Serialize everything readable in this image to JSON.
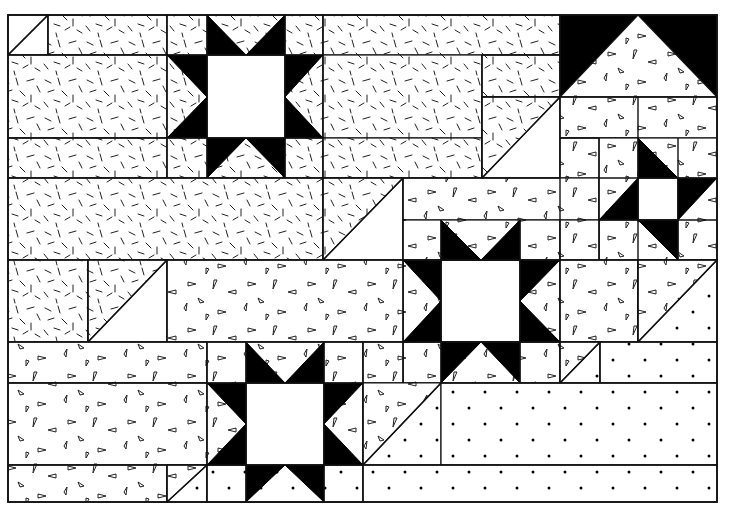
{
  "figure": {
    "colors": {
      "ink": "#000000",
      "background": "#ffffff"
    },
    "bounds": {
      "x": 8,
      "y": 15,
      "w": 709,
      "h": 487
    },
    "fabrics": {
      "dash": "dash-print",
      "tri": "triangle-print",
      "dot": "dot-print",
      "plain": "plain-white",
      "black": "solid-black"
    },
    "patches": [
      {
        "name": "corner-hst-top-left",
        "type": "rect",
        "x": 8,
        "y": 15,
        "w": 40,
        "h": 40,
        "fill": "plain"
      },
      {
        "name": "corner-hst-top-left-dash",
        "type": "poly",
        "points": "8,55 48,15 8,15",
        "fill": "plain"
      },
      {
        "name": "top-strip-1",
        "type": "rect",
        "x": 48,
        "y": 15,
        "w": 119,
        "h": 40,
        "fill": "dash"
      },
      {
        "name": "left-block-1",
        "type": "rect",
        "x": 8,
        "y": 55,
        "w": 159,
        "h": 83,
        "fill": "dash"
      },
      {
        "name": "left-strip-2",
        "type": "rect",
        "x": 8,
        "y": 138,
        "w": 159,
        "h": 40,
        "fill": "dash"
      },
      {
        "name": "star1-bg",
        "type": "rect",
        "x": 167,
        "y": 15,
        "w": 156,
        "h": 163,
        "fill": "dash"
      },
      {
        "name": "star1-center",
        "type": "rect",
        "x": 207,
        "y": 55,
        "w": 78,
        "h": 83,
        "fill": "plain"
      },
      {
        "name": "top-strip-2",
        "type": "rect",
        "x": 323,
        "y": 15,
        "w": 237,
        "h": 40,
        "fill": "dash"
      },
      {
        "name": "mid-block-2",
        "type": "rect",
        "x": 323,
        "y": 55,
        "w": 159,
        "h": 83,
        "fill": "dash"
      },
      {
        "name": "mid-strip-3",
        "type": "rect",
        "x": 323,
        "y": 138,
        "w": 159,
        "h": 40,
        "fill": "dash"
      },
      {
        "name": "small-rect-a",
        "type": "rect",
        "x": 482,
        "y": 55,
        "w": 78,
        "h": 42,
        "fill": "dash"
      },
      {
        "name": "hst-a-plain",
        "type": "rect",
        "x": 482,
        "y": 97,
        "w": 78,
        "h": 81,
        "fill": "plain"
      },
      {
        "name": "hst-a-dash",
        "type": "poly",
        "points": "482,97 560,97 482,178",
        "fill": "dash"
      },
      {
        "name": "house-bg",
        "type": "rect",
        "x": 560,
        "y": 15,
        "w": 157,
        "h": 82,
        "fill": "black"
      },
      {
        "name": "house-tri",
        "type": "poly",
        "points": "560,97 638,15 717,97",
        "fill": "tri"
      },
      {
        "name": "tri-strip-a",
        "type": "rect",
        "x": 560,
        "y": 97,
        "w": 157,
        "h": 41,
        "fill": "tri"
      },
      {
        "name": "tri-rect-b",
        "type": "rect",
        "x": 560,
        "y": 138,
        "w": 78,
        "h": 40,
        "fill": "tri"
      },
      {
        "name": "wide-dash-row",
        "type": "rect",
        "x": 8,
        "y": 178,
        "w": 315,
        "h": 82,
        "fill": "dash"
      },
      {
        "name": "hst-b-plain",
        "type": "rect",
        "x": 323,
        "y": 178,
        "w": 80,
        "h": 82,
        "fill": "plain"
      },
      {
        "name": "hst-b-dash",
        "type": "poly",
        "points": "323,178 403,178 323,260",
        "fill": "dash"
      },
      {
        "name": "tri-strip-c",
        "type": "rect",
        "x": 403,
        "y": 178,
        "w": 196,
        "h": 42,
        "fill": "tri"
      },
      {
        "name": "smallstar-bg",
        "type": "rect",
        "x": 599,
        "y": 138,
        "w": 118,
        "h": 122,
        "fill": "tri"
      },
      {
        "name": "smallstar-center",
        "type": "rect",
        "x": 638,
        "y": 178,
        "w": 40,
        "h": 42,
        "fill": "plain"
      },
      {
        "name": "star2-bg",
        "type": "rect",
        "x": 403,
        "y": 220,
        "w": 157,
        "h": 163,
        "fill": "tri"
      },
      {
        "name": "star2-center",
        "type": "rect",
        "x": 441,
        "y": 260,
        "w": 79,
        "h": 82,
        "fill": "plain"
      },
      {
        "name": "dash-square",
        "type": "rect",
        "x": 8,
        "y": 260,
        "w": 80,
        "h": 82,
        "fill": "dash"
      },
      {
        "name": "hst-c-plain",
        "type": "rect",
        "x": 88,
        "y": 260,
        "w": 79,
        "h": 82,
        "fill": "plain"
      },
      {
        "name": "hst-c-dash",
        "type": "poly",
        "points": "88,260 167,260 88,342",
        "fill": "dash"
      },
      {
        "name": "tri-block-d",
        "type": "rect",
        "x": 167,
        "y": 260,
        "w": 236,
        "h": 82,
        "fill": "tri"
      },
      {
        "name": "tri-rect-e",
        "type": "rect",
        "x": 560,
        "y": 220,
        "w": 39,
        "h": 40,
        "fill": "tri"
      },
      {
        "name": "tri-rect-f",
        "type": "rect",
        "x": 560,
        "y": 260,
        "w": 78,
        "h": 82,
        "fill": "tri"
      },
      {
        "name": "hst-d-dot",
        "type": "rect",
        "x": 638,
        "y": 260,
        "w": 79,
        "h": 82,
        "fill": "dot"
      },
      {
        "name": "hst-d-tri",
        "type": "poly",
        "points": "638,260 717,260 638,342",
        "fill": "tri"
      },
      {
        "name": "tri-strip-g",
        "type": "rect",
        "x": 8,
        "y": 342,
        "w": 199,
        "h": 41,
        "fill": "tri"
      },
      {
        "name": "tri-block-h",
        "type": "rect",
        "x": 8,
        "y": 383,
        "w": 199,
        "h": 82,
        "fill": "tri"
      },
      {
        "name": "tri-strip-i",
        "type": "rect",
        "x": 8,
        "y": 465,
        "w": 159,
        "h": 37,
        "fill": "tri"
      },
      {
        "name": "hst-e-dot",
        "type": "rect",
        "x": 167,
        "y": 465,
        "w": 40,
        "h": 37,
        "fill": "dot"
      },
      {
        "name": "hst-e-tri",
        "type": "poly",
        "points": "167,465 207,465 167,502",
        "fill": "tri"
      },
      {
        "name": "star3-bg",
        "type": "rect",
        "x": 207,
        "y": 342,
        "w": 156,
        "h": 160,
        "fill": "tri"
      },
      {
        "name": "star3-bottom-row",
        "type": "rect",
        "x": 207,
        "y": 465,
        "w": 156,
        "h": 37,
        "fill": "dot"
      },
      {
        "name": "star3-center",
        "type": "rect",
        "x": 246,
        "y": 383,
        "w": 78,
        "h": 82,
        "fill": "plain"
      },
      {
        "name": "tri-strip-j",
        "type": "rect",
        "x": 363,
        "y": 342,
        "w": 40,
        "h": 41,
        "fill": "tri"
      },
      {
        "name": "hst-f-dot",
        "type": "rect",
        "x": 363,
        "y": 383,
        "w": 78,
        "h": 82,
        "fill": "dot"
      },
      {
        "name": "hst-f-tri",
        "type": "poly",
        "points": "363,383 441,383 363,465",
        "fill": "tri"
      },
      {
        "name": "hst-g-dot",
        "type": "rect",
        "x": 560,
        "y": 342,
        "w": 40,
        "h": 41,
        "fill": "dot"
      },
      {
        "name": "hst-g-tri",
        "type": "poly",
        "points": "560,342 600,342 560,383",
        "fill": "tri"
      },
      {
        "name": "dot-strip-k",
        "type": "rect",
        "x": 600,
        "y": 342,
        "w": 117,
        "h": 41,
        "fill": "dot"
      },
      {
        "name": "dot-block-l",
        "type": "rect",
        "x": 441,
        "y": 383,
        "w": 276,
        "h": 82,
        "fill": "dot"
      },
      {
        "name": "dot-strip-m",
        "type": "rect",
        "x": 363,
        "y": 465,
        "w": 354,
        "h": 37,
        "fill": "dot"
      }
    ],
    "star_points": [
      {
        "name": "star1-point-top-left",
        "points": "207,15 246,55 207,55"
      },
      {
        "name": "star1-point-top-right",
        "points": "285,15 246,55 285,55"
      },
      {
        "name": "star1-point-left-top",
        "points": "167,55 207,55 207,97"
      },
      {
        "name": "star1-point-left-bottom",
        "points": "167,138 207,97 207,138"
      },
      {
        "name": "star1-point-right-top",
        "points": "323,55 285,55 285,97"
      },
      {
        "name": "star1-point-right-bottom",
        "points": "323,138 285,97 285,138"
      },
      {
        "name": "star1-point-bottom-left",
        "points": "207,138 246,138 207,178"
      },
      {
        "name": "star1-point-bottom-right",
        "points": "285,138 246,138 285,178"
      },
      {
        "name": "star2-point-top-left",
        "points": "441,220 481,260 441,260"
      },
      {
        "name": "star2-point-top-right",
        "points": "520,220 481,260 520,260"
      },
      {
        "name": "star2-point-left-top",
        "points": "403,260 441,260 441,301"
      },
      {
        "name": "star2-point-left-bottom",
        "points": "403,342 441,301 441,342"
      },
      {
        "name": "star2-point-right-top",
        "points": "560,260 520,260 520,301"
      },
      {
        "name": "star2-point-right-bottom",
        "points": "560,342 520,301 520,342"
      },
      {
        "name": "star2-point-bottom-left",
        "points": "441,342 481,342 441,383"
      },
      {
        "name": "star2-point-bottom-right",
        "points": "520,342 481,342 520,383"
      },
      {
        "name": "smallstar-point-top",
        "points": "638,138 678,178 638,178"
      },
      {
        "name": "smallstar-point-right",
        "points": "717,178 678,178 678,220"
      },
      {
        "name": "smallstar-point-bottom",
        "points": "638,220 678,220 678,260"
      },
      {
        "name": "smallstar-point-left",
        "points": "599,220 638,178 638,220"
      },
      {
        "name": "star3-point-top-left",
        "points": "246,342 285,383 246,383"
      },
      {
        "name": "star3-point-top-right",
        "points": "324,342 285,383 324,383"
      },
      {
        "name": "star3-point-left-top",
        "points": "207,383 246,383 246,424"
      },
      {
        "name": "star3-point-left-bottom",
        "points": "207,465 246,424 246,465"
      },
      {
        "name": "star3-point-right-top",
        "points": "363,383 324,383 324,424"
      },
      {
        "name": "star3-point-right-bottom",
        "points": "363,465 324,424 324,465"
      },
      {
        "name": "star3-point-bottom-left",
        "points": "246,465 285,465 246,502"
      },
      {
        "name": "star3-point-bottom-right",
        "points": "324,465 285,465 324,502"
      }
    ],
    "seams": [
      "167,15 167,178",
      "323,15 323,178",
      "207,15 207,178",
      "285,15 285,178",
      "167,55 323,55",
      "167,138 323,138",
      "403,178 403,383",
      "560,15 560,383",
      "441,220 441,383",
      "520,220 520,383",
      "403,260 560,260",
      "403,342 560,342",
      "599,138 599,260",
      "638,97 638,342",
      "678,138 678,260",
      "599,178 717,178",
      "599,220 717,220",
      "207,342 207,502",
      "363,342 363,502",
      "246,342 246,502",
      "324,342 324,502",
      "207,383 363,383",
      "207,465 363,465",
      "8,178 560,178",
      "8,260 717,260",
      "8,342 717,342",
      "8,383 207,383",
      "8,465 207,465",
      "441,383 717,383",
      "363,465 717,465",
      "560,97 717,97",
      "560,138 599,138",
      "482,55 482,178",
      "482,97 560,97",
      "323,178 323,260",
      "48,15 48,55",
      "8,55 167,55",
      "8,138 167,138",
      "88,260 88,342",
      "167,260 167,342",
      "600,342 600,383",
      "167,465 167,502",
      "482,55 560,55"
    ],
    "diagonals": [
      "8,55 48,15",
      "482,178 560,97",
      "323,260 403,178",
      "88,342 167,260",
      "638,342 717,260",
      "167,502 207,465",
      "363,465 441,383",
      "560,383 600,342"
    ]
  }
}
